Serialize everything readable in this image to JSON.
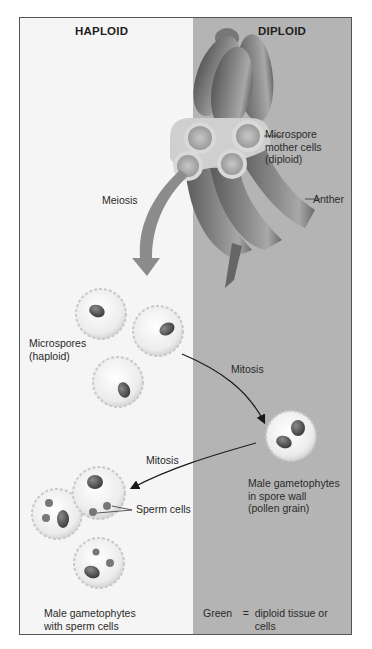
{
  "figure": {
    "regions": {
      "left": "HAPLOID",
      "right": "DIPLOID"
    },
    "labels": {
      "microspore_mother_cells_1": "Microspore",
      "microspore_mother_cells_2": "mother cells",
      "microspore_mother_cells_3": "(diploid)",
      "anther": "Anther",
      "meiosis": "Meiosis",
      "microspores_1": "Microspores",
      "microspores_2": "(haploid)",
      "mitosis_1": "Mitosis",
      "mitosis_2": "Mitosis",
      "pollen_1": "Male gametophytes",
      "pollen_2": "in spore wall",
      "pollen_3": "(pollen grain)",
      "sperm_cells": "Sperm cells",
      "gametophytes_1": "Male gametophytes",
      "gametophytes_2": "with sperm cells"
    },
    "legend": [
      {
        "key": "Green",
        "eq": "=",
        "value": "diploid tissue or cells"
      },
      {
        "key": "Yellow",
        "eq": "=",
        "value": "haploid tissue or cells"
      }
    ],
    "colors": {
      "haploid_bg": "#f5f5f5",
      "diploid_bg": "#b4b4b4",
      "anther": "#7a7a7a",
      "arrow": "#8c8c8c",
      "frame": "#555555"
    }
  }
}
